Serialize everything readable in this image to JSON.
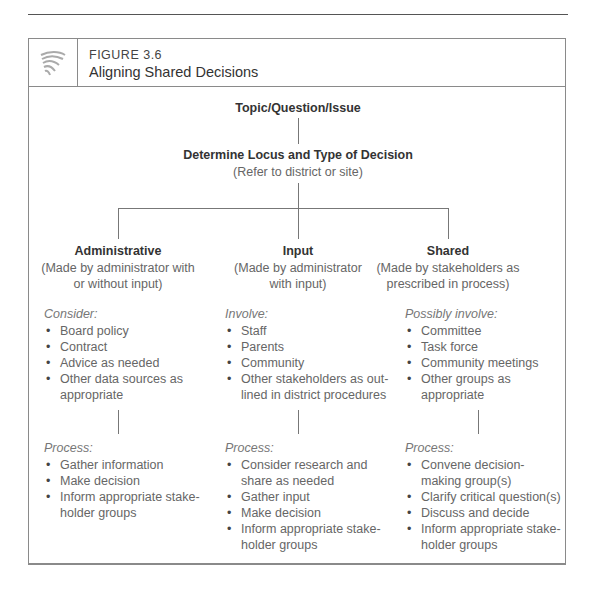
{
  "figure": {
    "number": "FIGURE 3.6",
    "title": "Aligning Shared Decisions",
    "icon": "decorative-swirl-icon"
  },
  "diagram": {
    "root": "Topic/Question/Issue",
    "level2": {
      "title": "Determine Locus and Type of Decision",
      "subtitle": "(Refer to district or site)"
    },
    "columns": [
      {
        "title": "Administrative",
        "subtitle_line1": "(Made by administrator with",
        "subtitle_line2": "or without input)",
        "list1_label": "Consider:",
        "list1": [
          "Board policy",
          "Contract",
          "Advice as needed",
          "Other data sources as appropriate"
        ],
        "list2_label": "Process:",
        "list2": [
          "Gather information",
          "Make decision",
          "Inform appropriate stake-holder groups"
        ]
      },
      {
        "title": "Input",
        "subtitle_line1": "(Made by administrator",
        "subtitle_line2": "with input)",
        "list1_label": "Involve:",
        "list1": [
          "Staff",
          "Parents",
          "Community",
          "Other stakeholders as out-lined in district procedures"
        ],
        "list2_label": "Process:",
        "list2": [
          "Consider research and share as needed",
          "Gather input",
          "Make decision",
          "Inform appropriate stake-holder groups"
        ]
      },
      {
        "title": "Shared",
        "subtitle_line1": "(Made by stakeholders as",
        "subtitle_line2": "prescribed in process)",
        "list1_label": "Possibly involve:",
        "list1": [
          "Committee",
          "Task force",
          "Community meetings",
          "Other groups as appropriate"
        ],
        "list2_label": "Process:",
        "list2": [
          "Convene decision-making group(s)",
          "Clarify critical question(s)",
          "Discuss and decide",
          "Inform appropriate stake-holder groups"
        ]
      }
    ]
  }
}
